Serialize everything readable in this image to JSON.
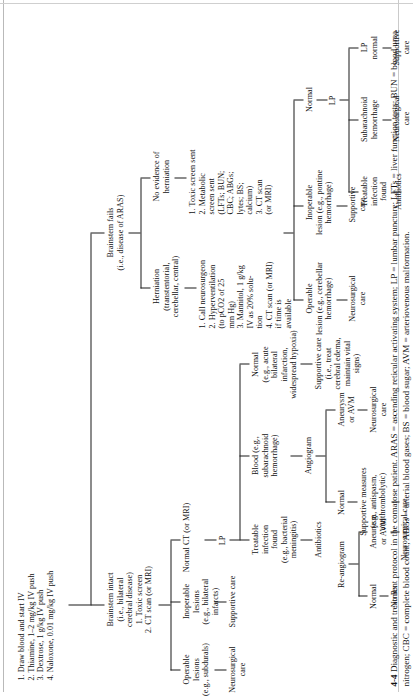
{
  "figure": {
    "number": "4-4",
    "caption_title": "Diagnostic and treatment protocol in the comatose patient.",
    "caption_abbrevs": "ARAS = ascending reticular activating system; LP = lumbar puncture; LFTs = liver function tests; BUN = blood urea nitrogen; CBC = complete blood count; ABGs = arterial blood gases; BS = blood sugar; AVM = arteriovenous malformation."
  },
  "nodes": {
    "initial_orders": "1. Draw blood and start IV\n2. Thiamine, 1–2 mg/kg IV  push\n3. Dextrose, 1 g/kg IV push\n4. Naloxone, 0.01 mg/kg IV push",
    "brainstem_fails": "Brainstem fails\n(i.e., disease of ARAS)",
    "brainstem_intact": "Brainstem intact\n(i.e., bilateral\ncerebral disease)\n1. Toxic screen\n2. CT scan (or MRI)",
    "herniation": "Herniation\n(transtentorial,\ncerebellar, central)",
    "no_herniation": "No evidence of\nherniation",
    "herniation_orders": "1. Call neurosurgeon\n2. Hyperventilation\n    (to pCO2 of 25\n    mm Hg)\n3. Mannitol, 1 g/kg\n    IV as 20% solu-\n    tion\n4. CT scan (or MRI)\n    if time is\n    available",
    "no_herniation_orders": "1. Toxic screen sent\n2. Metabolic\n    screen sent\n    (LFTs; BUN;\n    CBC; ABGs;\n    lytes; BS;\n    calcium)\n3. CT scan\n    (or MRI)",
    "normal_ct": "Normal CT (or MRI)",
    "operable_lesions": "Operable\nlesions\n(e.g., subdurals)",
    "inoperable_lesions": "Inoperable\nlesions\n(e.g., bilateral\ninfarcts)",
    "operable_lesions_tx": "Neurosurgical\ncare",
    "inoperable_lesions_tx": "Supportive care",
    "lp": "LP",
    "treatable_infection_cerebral": "Treatable\ninfection\nfound\n(e.g., bacterial\nmeningitis)",
    "treatable_infection_cerebral_tx": "Antibiotics",
    "blood_sah": "Blood (e.g.,\nsubarachnoid\nhemorrhage)",
    "blood_sah_next": "Angiogram",
    "normal_lp_brainstem": "Normal\n(e.g., acute\nbilateral\ninfarction,\nwidespread hypoxia)",
    "normal_lp_brainstem_tx": "Supportive care\n(i.e., treat\ncerebral edema,\nmaintain vital\nsigns)",
    "angiogram_normal": "Normal",
    "angiogram_aneurysm": "Aneurysm\nor AVM",
    "angiogram_normal_tx": "No Rx",
    "angiogram_aneurysm_tx": "Neurosurgical\ncare",
    "angiogram_re_normal": "Normal",
    "angiogram_re_aneurysm": "Aneurysm\nor AVM",
    "supportive_measures": "Supportive measures\n(e.g., antispasm,\nantithrombolytic)",
    "reangiogram": "Re-angiogram",
    "reangiogram_tx": "Neurosurgical care",
    "ct_operable": "Operable\nlesion (e.g., cerebellar\nhemorrhage)",
    "ct_inoperable": "Inoperable\nlesion (e.g., pontine\nhemorrhage)",
    "ct_normal": "Normal",
    "ct_operable_tx": "Neurosurgical\ncare",
    "ct_inoperable_tx": "Supportive\ncare",
    "ct_normal_lp": "LP",
    "lp_treatable_infection": "Treatable\ninfection\nfound",
    "lp_sah": "Subarachnoid\nhemorrhage",
    "lp_normal": "LP\nnormal",
    "lp_treatable_infection_tx": "Antibiotics",
    "lp_sah_tx": "Neurosurgical\ncare",
    "lp_normal_tx": "Supportive\ncare"
  }
}
